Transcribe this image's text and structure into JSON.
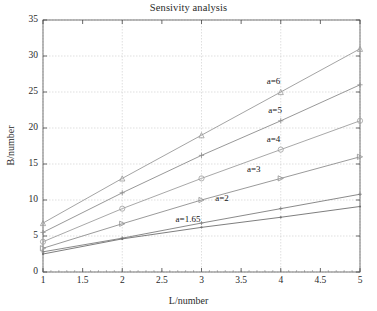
{
  "chart_data": {
    "type": "line",
    "title": "Sensivity analysis",
    "xlabel": "L/number",
    "ylabel": "B/number",
    "x": [
      1,
      2,
      3,
      4,
      5
    ],
    "xlim": [
      1,
      5
    ],
    "ylim": [
      0,
      35
    ],
    "xticks": [
      "1",
      "1.5",
      "2",
      "2.5",
      "3",
      "3.5",
      "4",
      "4.5",
      "5"
    ],
    "xtick_values": [
      1,
      1.5,
      2,
      2.5,
      3,
      3.5,
      4,
      4.5,
      5
    ],
    "yticks": [
      "0",
      "5",
      "10",
      "15",
      "20",
      "25",
      "30",
      "35"
    ],
    "ytick_values": [
      0,
      5,
      10,
      15,
      20,
      25,
      30,
      35
    ],
    "grid": true,
    "legend": "inline-annotations",
    "series": [
      {
        "name": "a=6",
        "label": "a=6",
        "marker": "triangle-up",
        "color": "#9a9a9a",
        "values": [
          6.8,
          13.0,
          19.0,
          25.0,
          31.0
        ]
      },
      {
        "name": "a=5",
        "label": "a=5",
        "marker": "plus",
        "color": "#8c8c8c",
        "values": [
          5.5,
          11.0,
          16.2,
          21.0,
          26.0
        ]
      },
      {
        "name": "a=4",
        "label": "a=4",
        "marker": "circle",
        "color": "#9e9e9e",
        "values": [
          4.2,
          8.8,
          13.0,
          17.0,
          21.0
        ]
      },
      {
        "name": "a=3",
        "label": "a=3",
        "marker": "triangle-right",
        "color": "#8f8f8f",
        "values": [
          3.3,
          6.7,
          10.0,
          13.0,
          16.0
        ]
      },
      {
        "name": "a=2",
        "label": "a=2",
        "marker": "plus-small",
        "color": "#7d7d7d",
        "values": [
          2.8,
          4.7,
          6.8,
          8.8,
          10.8
        ]
      },
      {
        "name": "a=1.65",
        "label": "a=1.65",
        "marker": "dot",
        "color": "#6f6f6f",
        "values": [
          2.5,
          4.6,
          6.2,
          7.6,
          9.1
        ]
      }
    ],
    "annotations": [
      {
        "text": "a=6",
        "x": 4.0,
        "y": 26.4
      },
      {
        "text": "a=5",
        "x": 4.02,
        "y": 22.3
      },
      {
        "text": "a=4",
        "x": 4.0,
        "y": 18.3
      },
      {
        "text": "a=3",
        "x": 3.75,
        "y": 14.1
      },
      {
        "text": "a=2",
        "x": 3.35,
        "y": 10.1
      },
      {
        "text": "a=1.65",
        "x": 2.85,
        "y": 7.25
      }
    ]
  }
}
